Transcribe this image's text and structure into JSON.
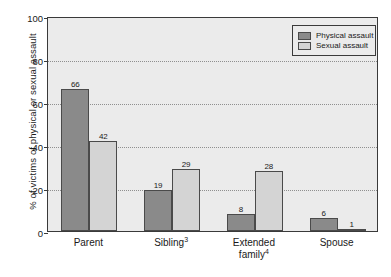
{
  "chart_data": {
    "type": "bar",
    "title": "",
    "xlabel": "",
    "ylabel": "% of victims of physical or sexual assault",
    "ylim": [
      0,
      100
    ],
    "yticks": [
      0,
      20,
      40,
      60,
      80,
      100
    ],
    "ytick_labels": [
      "0",
      "20",
      "40",
      "60",
      "80",
      "100"
    ],
    "grid": "horizontal-dotted",
    "legend_position": "top-right",
    "categories": [
      "Parent",
      "Sibling3",
      "Extended family4",
      "Spouse"
    ],
    "category_labels": [
      {
        "text": "Parent",
        "sup": ""
      },
      {
        "text": "Sibling",
        "sup": "3"
      },
      {
        "text": "Extended\nfamily",
        "sup": "4"
      },
      {
        "text": "Spouse",
        "sup": ""
      }
    ],
    "series": [
      {
        "name": "Physical assault",
        "color": "#8a8a8a",
        "values": [
          66,
          19,
          8,
          6
        ]
      },
      {
        "name": "Sexual assault",
        "color": "#d4d4d4",
        "values": [
          42,
          29,
          28,
          1
        ]
      }
    ]
  },
  "legend": {
    "items": [
      {
        "label": "Physical assault",
        "swatch": "physical"
      },
      {
        "label": "Sexual assault",
        "swatch": "sexual"
      }
    ]
  },
  "colors": {
    "physical": "#8a8a8a",
    "sexual": "#d4d4d4",
    "plot_background": "#ebebeb",
    "frame": "#3a3a3a",
    "gridline": "#8f8f8f",
    "text": "#1a1a1a"
  }
}
